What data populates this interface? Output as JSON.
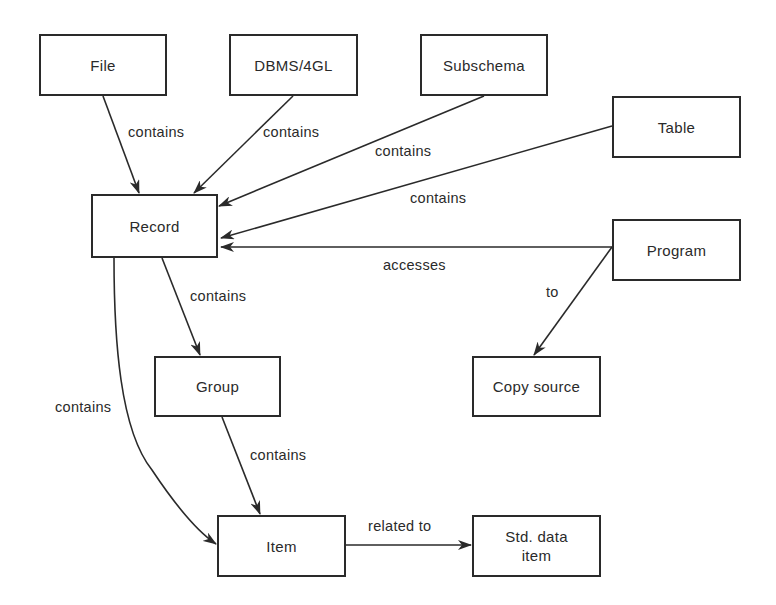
{
  "diagram": {
    "nodes": [
      {
        "id": "file",
        "label": "File",
        "x": 39,
        "y": 34,
        "w": 128,
        "h": 62
      },
      {
        "id": "dbms",
        "label": "DBMS/4GL",
        "x": 229,
        "y": 34,
        "w": 129,
        "h": 62
      },
      {
        "id": "subschema",
        "label": "Subschema",
        "x": 420,
        "y": 34,
        "w": 128,
        "h": 62
      },
      {
        "id": "table",
        "label": "Table",
        "x": 612,
        "y": 96,
        "w": 129,
        "h": 62
      },
      {
        "id": "record",
        "label": "Record",
        "x": 91,
        "y": 194,
        "w": 127,
        "h": 64
      },
      {
        "id": "program",
        "label": "Program",
        "x": 612,
        "y": 219,
        "w": 129,
        "h": 62
      },
      {
        "id": "group",
        "label": "Group",
        "x": 154,
        "y": 356,
        "w": 127,
        "h": 61
      },
      {
        "id": "copy_source",
        "label": "Copy source",
        "x": 472,
        "y": 356,
        "w": 129,
        "h": 61
      },
      {
        "id": "item",
        "label": "Item",
        "x": 217,
        "y": 515,
        "w": 129,
        "h": 62
      },
      {
        "id": "std_data_item",
        "label": "Std. data\nitem",
        "x": 472,
        "y": 515,
        "w": 129,
        "h": 62
      }
    ],
    "edges": [
      {
        "from": "file",
        "to": "record",
        "label": "contains",
        "label_x": 128,
        "label_y": 124
      },
      {
        "from": "dbms",
        "to": "record",
        "label": "contains",
        "label_x": 263,
        "label_y": 124
      },
      {
        "from": "subschema",
        "to": "record",
        "label": "contains",
        "label_x": 375,
        "label_y": 143
      },
      {
        "from": "table",
        "to": "record",
        "label": "contains",
        "label_x": 410,
        "label_y": 190
      },
      {
        "from": "program",
        "to": "record",
        "label": "accesses",
        "label_x": 383,
        "label_y": 257
      },
      {
        "from": "program",
        "to": "copy_source",
        "label": "to",
        "label_x": 546,
        "label_y": 284
      },
      {
        "from": "record",
        "to": "group",
        "label": "contains",
        "label_x": 190,
        "label_y": 288
      },
      {
        "from": "record",
        "to": "item",
        "label": "contains",
        "label_x": 55,
        "label_y": 399
      },
      {
        "from": "group",
        "to": "item",
        "label": "contains",
        "label_x": 250,
        "label_y": 447
      },
      {
        "from": "item",
        "to": "std_data_item",
        "label": "related to",
        "label_x": 368,
        "label_y": 518
      }
    ]
  },
  "colors": {
    "ink": "#2a2a2a",
    "background": "#ffffff"
  }
}
